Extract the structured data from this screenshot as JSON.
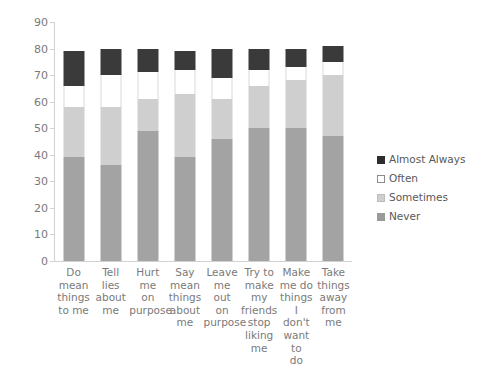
{
  "chart_data": {
    "type": "bar",
    "stacked": true,
    "title": "",
    "xlabel": "",
    "ylabel": "",
    "ylim": [
      0,
      90
    ],
    "ytick_step": 10,
    "grid": false,
    "legend_position": "right",
    "yticks": [
      "90",
      "80",
      "70",
      "60",
      "50",
      "40",
      "30",
      "20",
      "10",
      "0"
    ],
    "categories": [
      "Do mean things to me",
      "Tell lies about me",
      "Hurt me on purpose",
      "Say mean things about me",
      "Leave me out on purpose",
      "Try to make my friends stop liking me",
      "Make me do things I don't want to do",
      "Take things away from me"
    ],
    "category_lines": [
      [
        "Do",
        "mean",
        "things",
        "to me"
      ],
      [
        "Tell lies",
        "about",
        "me"
      ],
      [
        "Hurt me",
        "on",
        "purpose"
      ],
      [
        "Say",
        "mean",
        "things",
        "about",
        "me"
      ],
      [
        "Leave",
        "me out",
        "on",
        "purpose"
      ],
      [
        "Try to",
        "make",
        "my",
        "friends",
        "stop",
        "liking",
        "me"
      ],
      [
        "Make",
        "me do",
        "things I",
        "don't",
        "want to",
        "do"
      ],
      [
        "Take",
        "things",
        "away",
        "from me"
      ]
    ],
    "series": [
      {
        "name": "Never",
        "color": "#a3a3a3",
        "values": [
          39,
          36,
          49,
          39,
          46,
          50,
          50,
          47
        ]
      },
      {
        "name": "Sometimes",
        "color": "#cfcfcf",
        "values": [
          19,
          22,
          12,
          24,
          15,
          16,
          18,
          23
        ]
      },
      {
        "name": "Often",
        "color": "#ffffff",
        "values": [
          8,
          12,
          10,
          9,
          8,
          6,
          5,
          5
        ]
      },
      {
        "name": "Almost Always",
        "color": "#3a3a3a",
        "values": [
          13,
          10,
          9,
          7,
          11,
          8,
          7,
          6
        ]
      }
    ],
    "series_order_bottom_to_top": [
      "Never",
      "Sometimes",
      "Often",
      "Almost Always"
    ],
    "totals": [
      79,
      80,
      80,
      79,
      80,
      80,
      80,
      81
    ],
    "legend": [
      {
        "label": "Almost Always",
        "color": "#2d2d2d"
      },
      {
        "label": "Often",
        "color": "#ffffff"
      },
      {
        "label": "Sometimes",
        "color": "#cfcfcf"
      },
      {
        "label": "Never",
        "color": "#9a9a9a"
      }
    ]
  }
}
